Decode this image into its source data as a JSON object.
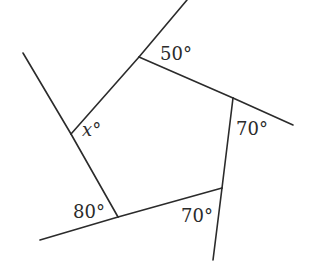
{
  "diagram": {
    "type": "geometry",
    "shape": "pentagon",
    "vertices": [
      {
        "id": "top",
        "x": 139,
        "y": 57
      },
      {
        "id": "right",
        "x": 233,
        "y": 98
      },
      {
        "id": "bottom_right",
        "x": 222,
        "y": 188
      },
      {
        "id": "bottom_left",
        "x": 118,
        "y": 217
      },
      {
        "id": "left",
        "x": 71,
        "y": 134
      }
    ],
    "rays": [
      {
        "id": "ray-top",
        "from": "top",
        "x1": 139,
        "y1": 57,
        "x2": 187,
        "y2": 0
      },
      {
        "id": "ray-right",
        "from": "right",
        "x1": 233,
        "y1": 98,
        "x2": 293,
        "y2": 125
      },
      {
        "id": "ray-bottom-right",
        "from": "bottom_right",
        "x1": 222,
        "y1": 188,
        "x2": 213,
        "y2": 260
      },
      {
        "id": "ray-bottom-left",
        "from": "bottom_left",
        "x1": 118,
        "y1": 217,
        "x2": 40,
        "y2": 240
      },
      {
        "id": "ray-left",
        "from": "left",
        "x1": 71,
        "y1": 134,
        "x2": 23,
        "y2": 53
      }
    ],
    "labels": {
      "top": "50°",
      "right": "70°",
      "bottom_right": "70°",
      "bottom_left": "80°",
      "left": "x°"
    },
    "label_positions": {
      "top": {
        "x": 160,
        "y": 60
      },
      "right": {
        "x": 236,
        "y": 135
      },
      "bottom_right": {
        "x": 181,
        "y": 222
      },
      "bottom_left": {
        "x": 73,
        "y": 218
      },
      "left": {
        "x": 82,
        "y": 136
      }
    },
    "stroke_color": "#2b2b2b",
    "background_color": "#ffffff"
  }
}
